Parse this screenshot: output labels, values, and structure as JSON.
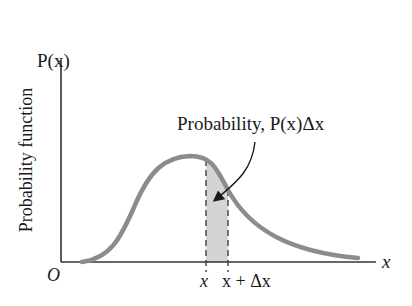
{
  "figure": {
    "y_axis_symbol": "P(x)",
    "y_axis_title": "Probability function",
    "x_axis_symbol": "x",
    "origin_label": "O",
    "tick_x": "x",
    "tick_x_plus_dx": "x + Δx",
    "annotation": "Probability, P(x)Δx",
    "colors": {
      "curve": "#8c8c8c",
      "shaded_region": "#d4d4d4",
      "axes": "#333333",
      "text": "#1a1a1a"
    }
  }
}
